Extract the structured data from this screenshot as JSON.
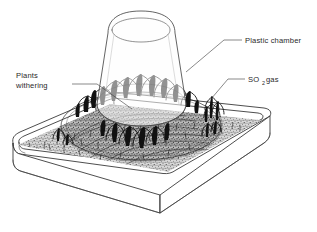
{
  "figure": {
    "background_color": "#ffffff",
    "ink_color": "#2e2e2e",
    "width": 317,
    "height": 232
  },
  "labels": [
    {
      "id": "plastic-chamber",
      "text": "Plastic chamber",
      "x": 244,
      "y": 43,
      "anchor": "start",
      "leader": "M 242,40 L 224,41 L 186,72"
    },
    {
      "id": "so2-gas",
      "text": "SO",
      "subscript": "2",
      "text_tail": " gas",
      "x": 247,
      "y": 82,
      "anchor": "start",
      "leader": "M 245,79 L 228,79 L 211,99"
    },
    {
      "id": "plants-withering",
      "line1": "Plants",
      "line2": "withering",
      "x": 16,
      "y": 78,
      "anchor": "start",
      "leader": "M 72,84 L 97,84 L 132,109"
    }
  ],
  "parts": {
    "chamber_name": "plastic-chamber",
    "tray_name": "soil-tray",
    "soil_name": "soil-bed",
    "withering_plants_name": "withering-plants-group",
    "healthy_plants_name": "healthy-plants-group"
  },
  "colors": {
    "ink": "#2e2e2e",
    "soil": "#6a6a6a",
    "plant": "#111111",
    "label": "#2a2a2a",
    "paper": "#ffffff"
  }
}
